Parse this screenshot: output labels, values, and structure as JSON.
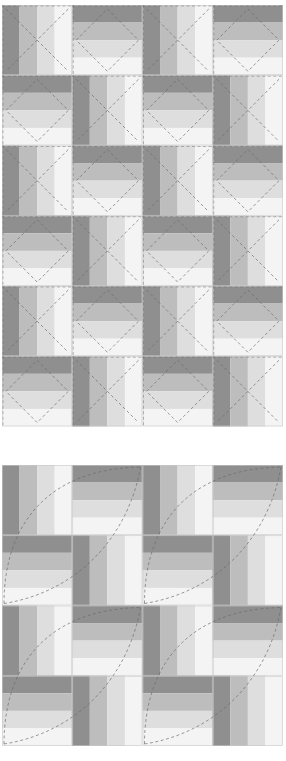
{
  "colors": {
    "strip1": "#8f8f8f",
    "strip2": "#bdbdbd",
    "strip3": "#dedede",
    "strip4": "#f4f4f4",
    "seam": "#c8c8c8",
    "quilting_line": "#6a6a6a"
  },
  "diagrams": [
    {
      "name": "rail-fence-diamond-quilting",
      "cols": 4,
      "rows": 6,
      "block_size": 70.25,
      "quilting": "diamond-x",
      "top": 5
    },
    {
      "name": "rail-fence-arc-quilting",
      "cols": 4,
      "rows": 4,
      "block_size": 70.25,
      "quilting": "arcs",
      "top": 465
    }
  ],
  "caption": ""
}
